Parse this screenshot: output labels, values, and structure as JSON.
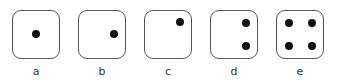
{
  "figure": {
    "dice": [
      {
        "label": "a",
        "left": 12,
        "pips": [
          [
            20,
            20
          ]
        ]
      },
      {
        "label": "b",
        "left": 78,
        "pips": [
          [
            32,
            20
          ]
        ]
      },
      {
        "label": "c",
        "left": 144,
        "pips": [
          [
            32,
            8
          ]
        ]
      },
      {
        "label": "d",
        "left": 210,
        "pips": [
          [
            32,
            9
          ],
          [
            32,
            32
          ]
        ]
      },
      {
        "label": "e",
        "left": 276,
        "pips": [
          [
            9,
            9
          ],
          [
            32,
            9
          ],
          [
            9,
            32
          ],
          [
            32,
            32
          ]
        ]
      }
    ]
  }
}
